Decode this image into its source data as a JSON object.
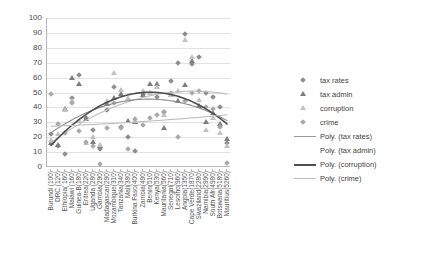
{
  "chart_data": {
    "type": "scatter",
    "title": "",
    "xlabel": "",
    "ylabel": "",
    "ylim": [
      0,
      100
    ],
    "ytick_labels": [
      "100",
      "90",
      "80",
      "70",
      "60",
      "50",
      "40",
      "30",
      "20",
      "10",
      "0"
    ],
    "yticks": [
      100,
      90,
      80,
      70,
      60,
      50,
      40,
      30,
      20,
      10,
      0
    ],
    "grid": true,
    "legend_position": "right",
    "categories": [
      "Burundi (100)",
      "DRC (120)",
      "Ethiopia( 160)",
      "Malawi (160)",
      "Guinea-B(180)",
      "Eritrea(220)",
      "Uganda (280)",
      "Gambia(290)",
      "Madagascar(290)",
      "Mozambique(310)",
      "Tanzania(340)",
      "Mali(380)",
      "Burkina Faso(400)",
      "Zambia(490)",
      "Benin(510)",
      "Kenya(530)",
      "Mauritania(560)",
      "Senegal(710)",
      "Lesotho(960)",
      "Angola(1350)",
      "Cape Verde(1870)",
      "Swaziland(2280)",
      "Namibia(2990)",
      "South Afr(4980)",
      "Botswana(5180)",
      "Mauritius(5260)"
    ],
    "series": [
      {
        "name": "tax rates",
        "marker": "diamond",
        "color": "#8e8e8e",
        "values": [
          22,
          14,
          9,
          46,
          62,
          33,
          25,
          12,
          38,
          54,
          27,
          20,
          11,
          49,
          50,
          47,
          37,
          58,
          70,
          89,
          69,
          74,
          50,
          47,
          40,
          16
        ]
      },
      {
        "name": "tax admin",
        "marker": "triangle",
        "color": "#7d7d7d",
        "values": [
          16,
          15,
          39,
          60,
          56,
          32,
          17,
          14,
          42,
          46,
          49,
          31,
          30,
          48,
          56,
          56,
          26,
          48,
          44,
          55,
          71,
          41,
          30,
          36,
          29,
          19
        ]
      },
      {
        "name": "corruption",
        "marker": "triangle-light",
        "color": "#c2c2c2",
        "values": [
          18,
          22,
          38,
          44,
          31,
          16,
          20,
          15,
          44,
          63,
          52,
          46,
          31,
          51,
          50,
          54,
          35,
          48,
          51,
          85,
          74,
          45,
          25,
          33,
          23,
          14
        ]
      },
      {
        "name": "crime",
        "marker": "diamond-light",
        "color": "#a9a9a9",
        "values": [
          49,
          29,
          23,
          43,
          24,
          17,
          14,
          2,
          26,
          43,
          26,
          12,
          32,
          28,
          33,
          35,
          37,
          50,
          20,
          44,
          50,
          51,
          40,
          39,
          27,
          3
        ]
      }
    ],
    "trendlines": [
      {
        "name": "Poly. (tax rates)",
        "style": "thin-light",
        "color": "#bdbdbd"
      },
      {
        "name": "Poly. (tax admin)",
        "style": "invisible",
        "color": "#ffffff"
      },
      {
        "name": "Poly. (corruption)",
        "style": "thick",
        "color": "#4f4f4f"
      },
      {
        "name": "Poly. (crime)",
        "style": "thin-lighter",
        "color": "#bdbdbd"
      }
    ]
  },
  "legend": {
    "entries": [
      {
        "label": "tax rates",
        "key": "diamond"
      },
      {
        "label": "tax admin",
        "key": "triangle"
      },
      {
        "label": "corruption",
        "key": "triangle-light"
      },
      {
        "label": "crime",
        "key": "diamond-light"
      },
      {
        "label": "Poly. (tax rates)",
        "key": "line-light"
      },
      {
        "label": "Poly. (tax admin)",
        "key": "line-none"
      },
      {
        "label": "Poly. (corruption)",
        "key": "line-thick"
      },
      {
        "label": "Poly. (crime)",
        "key": "line-lighter"
      }
    ]
  }
}
